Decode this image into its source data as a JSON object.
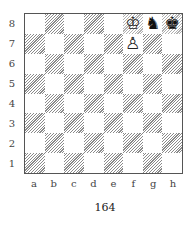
{
  "diagram": {
    "caption": "164",
    "ranks": [
      "8",
      "7",
      "6",
      "5",
      "4",
      "3",
      "2",
      "1"
    ],
    "files": [
      "a",
      "b",
      "c",
      "d",
      "e",
      "f",
      "g",
      "h"
    ],
    "pieces": [
      {
        "square": "f8",
        "piece": "white-king",
        "glyph": "♔"
      },
      {
        "square": "g8",
        "piece": "black-knight",
        "glyph": "♞"
      },
      {
        "square": "h8",
        "piece": "black-king",
        "glyph": "♚"
      },
      {
        "square": "f7",
        "piece": "white-pawn",
        "glyph": "♙"
      }
    ]
  }
}
